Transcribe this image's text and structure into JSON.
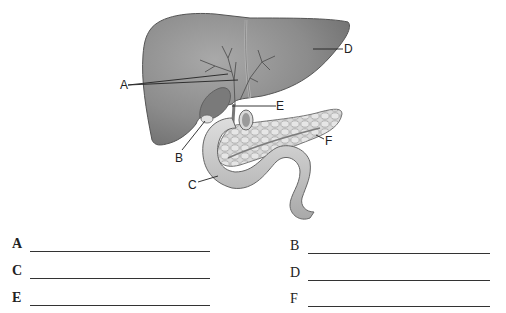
{
  "diagram": {
    "colors": {
      "liver": "#8a8a8a",
      "liver_dark": "#6e6e6e",
      "liver_light": "#a8a8a8",
      "duodenum": "#c8c8c8",
      "pancreas": "#d6d6d6",
      "line": "#222222"
    },
    "callouts": [
      {
        "letter": "A",
        "target": "hepatic ducts"
      },
      {
        "letter": "B",
        "target": "gallbladder"
      },
      {
        "letter": "C",
        "target": "duodenum"
      },
      {
        "letter": "D",
        "target": "liver"
      },
      {
        "letter": "E",
        "target": "common bile duct"
      },
      {
        "letter": "F",
        "target": "pancreas"
      }
    ]
  },
  "answers": {
    "left": [
      {
        "letter": "A",
        "value": ""
      },
      {
        "letter": "C",
        "value": ""
      },
      {
        "letter": "E",
        "value": ""
      }
    ],
    "right": [
      {
        "letter": "B",
        "value": ""
      },
      {
        "letter": "D",
        "value": ""
      },
      {
        "letter": "F",
        "value": ""
      }
    ]
  }
}
